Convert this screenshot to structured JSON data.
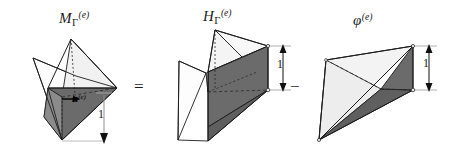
{
  "figure": {
    "width": 449,
    "height": 156,
    "background": "#ffffff",
    "caption_equation": "M_Gamma^(e) = H_Gamma^(e) - phi^(e)",
    "panels": [
      {
        "id": "left",
        "name": "M-gamma-e",
        "label_base": "M",
        "label_sub": "Γ",
        "label_sup": "(e)",
        "label_plain": "MΓ(e)",
        "dimension_label": "1",
        "normal_vector_label": "n",
        "normal_vector_sup": "(e)",
        "description": "tetrahedron with dark shaded cut face and downward unit normal"
      },
      {
        "id": "middle",
        "name": "H-gamma-e",
        "label_base": "H",
        "label_sub": "Γ",
        "label_sup": "(e)",
        "label_plain": "HΓ(e)",
        "dimension_label": "1",
        "description": "prism-like wedge with dark shaded vertical quadrilateral face"
      },
      {
        "id": "right",
        "name": "phi-e",
        "label_base": "φ",
        "label_sub": "",
        "label_sup": "(e)",
        "label_plain": "φ(e)",
        "dimension_label": "1",
        "description": "tetrahedron with dark shaded lower face"
      }
    ],
    "operators": {
      "equals": "=",
      "minus": "−"
    },
    "colors": {
      "dark_face": "#6b6b6b",
      "mid_face": "#9a9a9a",
      "light_face": "#f3f3f3",
      "pale_face": "#fbfbfb",
      "outline": "#1c1c1c",
      "dimension_line": "#8d8d8d",
      "arrow": "#111111",
      "background": "#ffffff"
    }
  }
}
